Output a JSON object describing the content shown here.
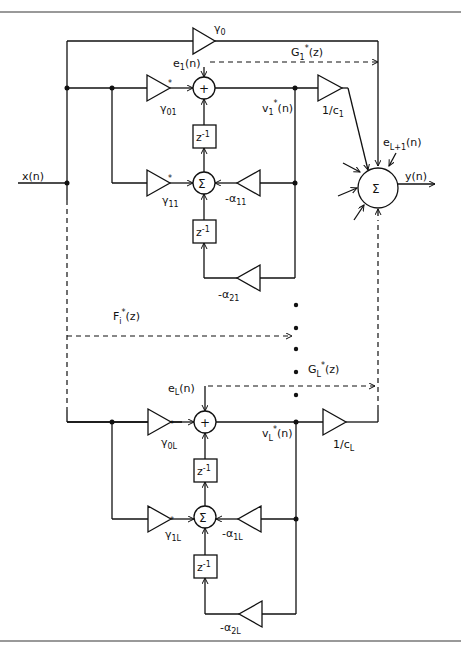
{
  "diagram": {
    "type": "block-diagram",
    "input_label": "x(n)",
    "output_label": "y(n)",
    "direct_gain": "γ0",
    "output_summer_symbol": "Σ",
    "extra_error_label": "eL+1(n)",
    "sections": [
      {
        "index": "1",
        "error_label": "e1(n)",
        "feedforward_gain_0": "γ*01",
        "feedforward_gain_1": "γ*11",
        "feedback_gain_1": "-α11",
        "feedback_gain_2": "-α21",
        "state_label": "v*1(n)",
        "output_scale": "1/c1",
        "transfer_label": "G*1(z)",
        "adder_symbol": "+",
        "summer_symbol": "Σ",
        "delay_label": "z-1"
      },
      {
        "index": "L",
        "error_label": "eL(n)",
        "feedforward_gain_0": "γ*0L",
        "feedforward_gain_1": "γ*1L",
        "feedback_gain_1": "-α1L",
        "feedback_gain_2": "-α2L",
        "state_label": "v*L(n)",
        "output_scale": "1/cL",
        "transfer_label": "G*L(z)",
        "adder_symbol": "+",
        "summer_symbol": "Σ",
        "delay_label": "z-1"
      }
    ],
    "intermediate_transfer_label": "F*i(z)",
    "ellipsis": "• • • • •"
  },
  "text": {
    "x": "x(n)",
    "y": "y(n)",
    "g0": "γ",
    "g0_sub": "0",
    "eL1_main": "e",
    "eL1_sub": "L+1",
    "eL1_tail": "(n)",
    "sigma": "Σ",
    "plus": "+",
    "z": "z",
    "zexp": "-1",
    "F_main": "F",
    "F_sub": "i",
    "F_tail": "(z)",
    "star": "*",
    "s1": {
      "e_main": "e",
      "e_sub": "1",
      "e_tail": "(n)",
      "g0_main": "γ",
      "g0_sub": "01",
      "g1_main": "γ",
      "g1_sub": "11",
      "a1_main": "-α",
      "a1_sub": "11",
      "a2_main": "-α",
      "a2_sub": "21",
      "v_main": "v",
      "v_sub": "1",
      "v_tail": "(n)",
      "c_main": "1/c",
      "c_sub": "1",
      "G_main": "G",
      "G_sub": "1",
      "G_tail": "(z)"
    },
    "sL": {
      "e_main": "e",
      "e_sub": "L",
      "e_tail": "(n)",
      "g0_main": "γ",
      "g0_sub": "0L",
      "g1_main": "γ",
      "g1_sub": "1L",
      "a1_main": "-α",
      "a1_sub": "1L",
      "a2_main": "-α",
      "a2_sub": "2L",
      "v_main": "v",
      "v_sub": "L",
      "v_tail": "(n)",
      "c_main": "1/c",
      "c_sub": "L",
      "G_main": "G",
      "G_sub": "L",
      "G_tail": "(z)"
    }
  }
}
